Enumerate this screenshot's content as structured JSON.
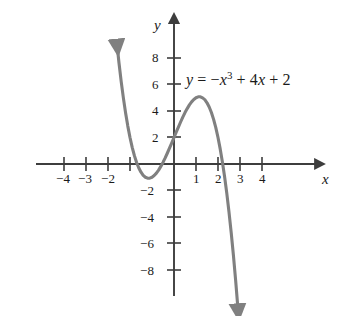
{
  "figure": {
    "equation_label": "y = −x³ + 4x + 2",
    "equation_parts": {
      "lhs": "y",
      "equals": "=",
      "minus": "−",
      "var_x": "x",
      "exponent": "3",
      "plus1": "+",
      "term2": "4",
      "var_x2": "x",
      "plus2": "+",
      "constant": "2"
    },
    "x_axis_name": "x",
    "y_axis_name": "y",
    "curve_color": "#808080",
    "axis_color": "#3d3d3d",
    "text_color": "#1a1a1a",
    "background_color": "#ffffff"
  },
  "chart_data": {
    "type": "line",
    "title": "",
    "subtitle": "",
    "xlabel": "x",
    "ylabel": "y",
    "function": "y = -x^3 + 4x + 2",
    "series": [
      {
        "name": "y = −x³ + 4x + 2",
        "color": "#808080",
        "x": [
          -2.6,
          -2.5,
          -2.4,
          -2.3,
          -2.2,
          -2.1,
          -2.0,
          -1.9,
          -1.8,
          -1.7,
          -1.6,
          -1.5,
          -1.4,
          -1.3,
          -1.2,
          -1.1,
          -1.0,
          -0.9,
          -0.8,
          -0.7,
          -0.6,
          -0.5,
          -0.4,
          -0.3,
          -0.2,
          -0.1,
          0.0,
          0.1,
          0.2,
          0.3,
          0.4,
          0.5,
          0.6,
          0.7,
          0.8,
          0.9,
          1.0,
          1.1,
          1.2,
          1.3,
          1.4,
          1.5,
          1.6,
          1.7,
          1.8,
          1.9,
          2.0,
          2.1,
          2.2,
          2.3,
          2.4,
          2.5,
          2.6,
          2.7,
          2.8,
          2.9
        ],
        "y": [
          9.18,
          7.62,
          6.22,
          4.97,
          3.85,
          2.86,
          2.0,
          1.26,
          0.63,
          0.11,
          -0.3,
          -0.62,
          -0.86,
          -1.0,
          -1.07,
          -1.07,
          -1.0,
          -0.87,
          -0.69,
          -0.46,
          -0.18,
          0.12,
          0.46,
          0.83,
          1.21,
          1.6,
          2.0,
          2.4,
          2.79,
          3.17,
          3.54,
          3.88,
          4.18,
          4.46,
          4.69,
          4.87,
          5.0,
          5.07,
          5.07,
          4.99,
          4.86,
          4.62,
          4.3,
          3.89,
          3.37,
          2.74,
          2.0,
          1.14,
          0.15,
          -0.97,
          -2.22,
          -3.63,
          -5.18,
          -6.88,
          -8.75,
          -10.79
        ]
      }
    ],
    "xlim": [
      -5.2,
      5.6
    ],
    "ylim": [
      -9.5,
      9.2
    ],
    "x_ticks": [
      -4,
      -3,
      -2,
      -1,
      1,
      2,
      3,
      4
    ],
    "x_tick_labels": [
      "−4",
      "−3",
      "−2",
      "",
      "1",
      "2",
      "3",
      "4"
    ],
    "y_ticks": [
      8,
      6,
      4,
      2,
      -2,
      -4,
      -6,
      -8
    ],
    "y_tick_labels": [
      "8",
      "6",
      "4",
      "2",
      "−2",
      "−4",
      "−6",
      "−8"
    ],
    "grid": false,
    "legend": false,
    "legend_position": "none",
    "annotations": [
      {
        "text": "y = −x³ + 4x + 2",
        "x": 1.1,
        "y": 6.0
      }
    ],
    "features": {
      "local_maximum": {
        "x": 1.155,
        "y": 5.08
      },
      "local_minimum": {
        "x": -1.155,
        "y": -1.08
      },
      "y_intercept": {
        "x": 0,
        "y": 2
      },
      "curve_end_arrows": [
        "upper-left",
        "lower-right"
      ]
    }
  },
  "ticks": {
    "x": [
      {
        "label": "−4",
        "left": 56,
        "top": 172
      },
      {
        "label": "−3",
        "left": 78,
        "top": 172
      },
      {
        "label": "−2",
        "left": 101,
        "top": 172
      },
      {
        "label": "1",
        "left": 193,
        "top": 172
      },
      {
        "label": "2",
        "left": 215,
        "top": 172
      },
      {
        "label": "3",
        "left": 237,
        "top": 172
      },
      {
        "label": "4",
        "left": 259,
        "top": 172
      }
    ],
    "y": [
      {
        "label": "8",
        "left": 150,
        "top": 51
      },
      {
        "label": "6",
        "left": 150,
        "top": 78
      },
      {
        "label": "4",
        "left": 150,
        "top": 104
      },
      {
        "label": "2",
        "left": 150,
        "top": 131
      },
      {
        "label": "−2",
        "left": 141,
        "top": 184
      },
      {
        "label": "−4",
        "left": 141,
        "top": 211
      },
      {
        "label": "−6",
        "left": 141,
        "top": 237
      },
      {
        "label": "−8",
        "left": 141,
        "top": 264
      }
    ]
  }
}
